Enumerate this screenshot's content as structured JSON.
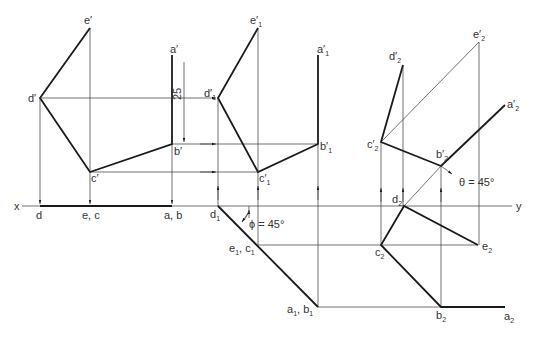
{
  "diagram": {
    "type": "orthographic-projection-auxiliary-views",
    "axis": {
      "x_label": "x",
      "y_label": "y"
    },
    "view1": {
      "elevation_labels": {
        "a": "a′",
        "b": "b′",
        "c": "c′",
        "d": "d′",
        "e": "e′"
      },
      "plan_labels": {
        "d": "d",
        "ec": "e, c",
        "ab": "a, b"
      },
      "dimension": "25"
    },
    "view2": {
      "elevation_labels": {
        "a": "a′",
        "b": "b′",
        "c": "c′",
        "d": "d′",
        "e": "e′",
        "sub": "1"
      },
      "plan_labels": {
        "d": "d",
        "ec_e": "e",
        "ec_c": "c",
        "ab_a": "a",
        "ab_b": "b",
        "sub": "1"
      },
      "angle_label": "ϕ = 45°"
    },
    "view3": {
      "elevation_labels": {
        "a": "a′",
        "b": "b′",
        "c": "c′",
        "d": "d′",
        "e": "e′",
        "sub": "2"
      },
      "plan_labels": {
        "a": "a",
        "b": "b",
        "c": "c",
        "d": "d",
        "e": "e",
        "sub": "2"
      },
      "angle_label": "θ = 45°"
    }
  }
}
